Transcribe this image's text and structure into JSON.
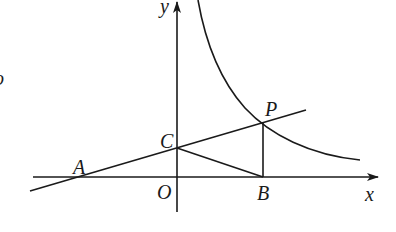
{
  "diagram": {
    "labels": {
      "y_axis": "y",
      "x_axis": "x",
      "origin": "O",
      "A": "A",
      "B": "B",
      "C": "C",
      "P": "P",
      "fragment": "o"
    },
    "colors": {
      "stroke": "#1a1a1a",
      "background": "#ffffff"
    },
    "points": {
      "O": [
        177,
        177
      ],
      "A": [
        78,
        177
      ],
      "B": [
        263,
        177
      ],
      "C": [
        177,
        148
      ],
      "P": [
        263,
        122
      ]
    }
  }
}
